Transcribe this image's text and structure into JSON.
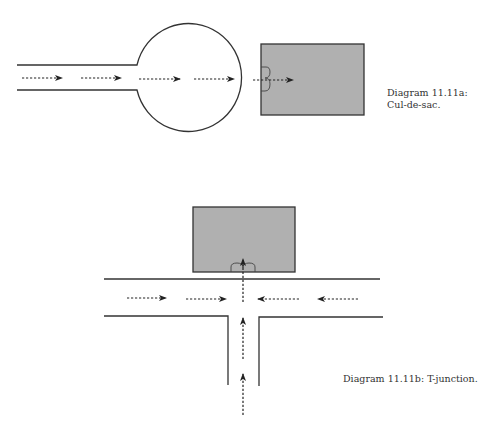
{
  "colors": {
    "line": "#333333",
    "building_fill": "#b0b0b0",
    "background": "#ffffff"
  },
  "diagram_a": {
    "caption_line1": "Diagram 11.11a:",
    "caption_line2": "Cul-de-sac.",
    "type": "cul-de-sac",
    "elements": [
      "road",
      "turning-circle",
      "building",
      "door",
      "flow-arrows"
    ],
    "arrow_direction": "right"
  },
  "diagram_b": {
    "caption": "Diagram 11.11b: T-junction.",
    "type": "T-junction",
    "elements": [
      "main-road",
      "side-road",
      "building",
      "door",
      "flow-arrows"
    ],
    "arrow_directions": [
      "right",
      "right",
      "left",
      "left",
      "up",
      "up",
      "up"
    ]
  }
}
